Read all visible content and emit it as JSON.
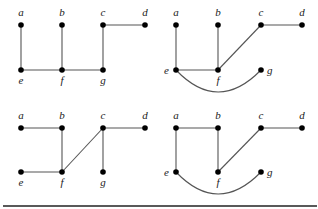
{
  "graphs": [
    {
      "id": "graph-1",
      "nodes": [
        {
          "id": "a",
          "label": "a",
          "x": 21,
          "y": 25,
          "lx": 21,
          "ly": 16,
          "anchor": "middle"
        },
        {
          "id": "b",
          "label": "b",
          "x": 62,
          "y": 25,
          "lx": 62,
          "ly": 16,
          "anchor": "middle"
        },
        {
          "id": "c",
          "label": "c",
          "x": 103,
          "y": 25,
          "lx": 103,
          "ly": 16,
          "anchor": "middle"
        },
        {
          "id": "d",
          "label": "d",
          "x": 145,
          "y": 25,
          "lx": 145,
          "ly": 16,
          "anchor": "middle"
        },
        {
          "id": "e",
          "label": "e",
          "x": 21,
          "y": 70,
          "lx": 21,
          "ly": 84,
          "anchor": "middle"
        },
        {
          "id": "f",
          "label": "f",
          "x": 62,
          "y": 70,
          "lx": 62,
          "ly": 84,
          "anchor": "middle"
        },
        {
          "id": "g",
          "label": "g",
          "x": 103,
          "y": 70,
          "lx": 103,
          "ly": 84,
          "anchor": "middle"
        }
      ],
      "edges": [
        [
          "a",
          "e"
        ],
        [
          "b",
          "f"
        ],
        [
          "e",
          "f"
        ],
        [
          "f",
          "g"
        ],
        [
          "g",
          "c"
        ],
        [
          "c",
          "d"
        ]
      ],
      "arcs": []
    },
    {
      "id": "graph-2",
      "nodes": [
        {
          "id": "a",
          "label": "a",
          "x": 176,
          "y": 25,
          "lx": 176,
          "ly": 16,
          "anchor": "middle"
        },
        {
          "id": "b",
          "label": "b",
          "x": 218,
          "y": 25,
          "lx": 218,
          "ly": 16,
          "anchor": "middle"
        },
        {
          "id": "c",
          "label": "c",
          "x": 261,
          "y": 25,
          "lx": 261,
          "ly": 16,
          "anchor": "middle"
        },
        {
          "id": "d",
          "label": "d",
          "x": 302,
          "y": 25,
          "lx": 302,
          "ly": 16,
          "anchor": "middle"
        },
        {
          "id": "e",
          "label": "e",
          "x": 176,
          "y": 70,
          "lx": 169,
          "ly": 74,
          "anchor": "end"
        },
        {
          "id": "f",
          "label": "f",
          "x": 218,
          "y": 70,
          "lx": 218,
          "ly": 84,
          "anchor": "middle"
        },
        {
          "id": "g",
          "label": "g",
          "x": 261,
          "y": 70,
          "lx": 267,
          "ly": 74,
          "anchor": "start"
        }
      ],
      "edges": [
        [
          "a",
          "e"
        ],
        [
          "b",
          "f"
        ],
        [
          "e",
          "f"
        ],
        [
          "f",
          "c"
        ],
        [
          "c",
          "d"
        ]
      ],
      "arcs": [
        {
          "from": "e",
          "to": "g",
          "cx": 218,
          "cy": 114
        }
      ]
    },
    {
      "id": "graph-3",
      "nodes": [
        {
          "id": "a",
          "label": "a",
          "x": 21,
          "y": 128,
          "lx": 21,
          "ly": 119,
          "anchor": "middle"
        },
        {
          "id": "b",
          "label": "b",
          "x": 62,
          "y": 128,
          "lx": 62,
          "ly": 119,
          "anchor": "middle"
        },
        {
          "id": "c",
          "label": "c",
          "x": 103,
          "y": 128,
          "lx": 103,
          "ly": 119,
          "anchor": "middle"
        },
        {
          "id": "d",
          "label": "d",
          "x": 145,
          "y": 128,
          "lx": 145,
          "ly": 119,
          "anchor": "middle"
        },
        {
          "id": "e",
          "label": "e",
          "x": 21,
          "y": 172,
          "lx": 21,
          "ly": 186,
          "anchor": "middle"
        },
        {
          "id": "f",
          "label": "f",
          "x": 62,
          "y": 172,
          "lx": 62,
          "ly": 186,
          "anchor": "middle"
        },
        {
          "id": "g",
          "label": "g",
          "x": 103,
          "y": 172,
          "lx": 103,
          "ly": 186,
          "anchor": "middle"
        }
      ],
      "edges": [
        [
          "a",
          "b"
        ],
        [
          "b",
          "f"
        ],
        [
          "e",
          "f"
        ],
        [
          "f",
          "c"
        ],
        [
          "c",
          "d"
        ],
        [
          "c",
          "g"
        ]
      ],
      "arcs": []
    },
    {
      "id": "graph-4",
      "nodes": [
        {
          "id": "a",
          "label": "a",
          "x": 176,
          "y": 128,
          "lx": 176,
          "ly": 119,
          "anchor": "middle"
        },
        {
          "id": "b",
          "label": "b",
          "x": 218,
          "y": 128,
          "lx": 218,
          "ly": 119,
          "anchor": "middle"
        },
        {
          "id": "c",
          "label": "c",
          "x": 261,
          "y": 128,
          "lx": 261,
          "ly": 119,
          "anchor": "middle"
        },
        {
          "id": "d",
          "label": "d",
          "x": 302,
          "y": 128,
          "lx": 302,
          "ly": 119,
          "anchor": "middle"
        },
        {
          "id": "e",
          "label": "e",
          "x": 176,
          "y": 172,
          "lx": 169,
          "ly": 176,
          "anchor": "end"
        },
        {
          "id": "f",
          "label": "f",
          "x": 218,
          "y": 172,
          "lx": 218,
          "ly": 186,
          "anchor": "middle"
        },
        {
          "id": "g",
          "label": "g",
          "x": 261,
          "y": 172,
          "lx": 267,
          "ly": 176,
          "anchor": "start"
        }
      ],
      "edges": [
        [
          "a",
          "b"
        ],
        [
          "a",
          "e"
        ],
        [
          "b",
          "f"
        ],
        [
          "f",
          "c"
        ],
        [
          "c",
          "d"
        ]
      ],
      "arcs": [
        {
          "from": "e",
          "to": "g",
          "cx": 218,
          "cy": 216
        }
      ]
    }
  ],
  "rule": {
    "x1": 3,
    "x2": 317,
    "y": 206
  }
}
